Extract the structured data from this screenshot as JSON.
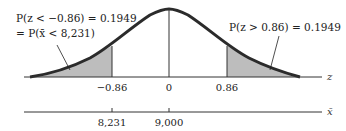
{
  "diagram": {
    "type": "normal-distribution",
    "annotations": {
      "left_line1": "P(z < −0.86) = 0.1949",
      "left_line2": "= P(x̄ < 8,231)",
      "right": "P(z > 0.86) = 0.1949"
    },
    "z_axis": {
      "label": "z",
      "ticks": [
        "−0.86",
        "0",
        "0.86"
      ]
    },
    "xbar_axis": {
      "label": "x̄",
      "ticks": [
        "8,231",
        "9,000"
      ]
    },
    "colors": {
      "curve": "#2b2b2b",
      "shade": "#bdbdbd",
      "axis": "#333333"
    }
  }
}
